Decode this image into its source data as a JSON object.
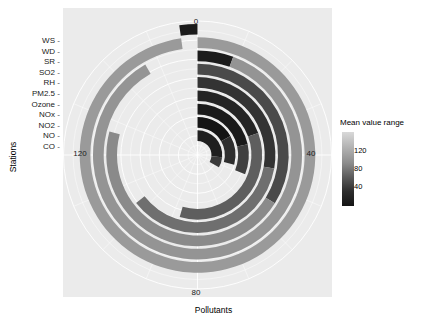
{
  "figure": {
    "background": "#ffffff",
    "panel_background": "#ebebeb",
    "grid_color": "#ffffff"
  },
  "axes": {
    "y_title": "Stations",
    "x_title": "Pollutants"
  },
  "legend": {
    "title": "Mean value range",
    "ticks": [
      "120",
      "80",
      "40"
    ],
    "gradient_high": "#d9d9d9",
    "gradient_low": "#141414"
  },
  "chart_data": {
    "type": "bar",
    "title": "",
    "subtitle": "",
    "xlabel": "Pollutants",
    "ylabel": "Stations",
    "coord": "polar-spiral",
    "grid": true,
    "legend_position": "right",
    "legend_title": "Mean value range",
    "legend_ticks": [
      120,
      80,
      40
    ],
    "colorscale": "grayscale (dark = low mean value, light = high mean value)",
    "angular_axis": {
      "label": "Pollutants",
      "ticks": [
        0,
        40,
        80,
        120
      ],
      "tick_labels": [
        "0",
        "40",
        "80",
        "120"
      ],
      "tick_angles_deg": [
        0,
        90,
        180,
        270
      ],
      "range": [
        0,
        160
      ]
    },
    "radial_axis": {
      "label": "Stations",
      "categories": [
        "CO",
        "NO",
        "NO2",
        "NOx",
        "Ozone",
        "PM2.5",
        "RH",
        "SO2",
        "SR",
        "WD",
        "WS"
      ],
      "tick_labels": [
        "WS",
        "WD",
        "SR",
        "SO2",
        "RH",
        "PM2.5",
        "Ozone",
        "NOx",
        "NO2",
        "NO",
        "CO"
      ],
      "note": "tick labels listed top-to-bottom as rendered on the left axis"
    },
    "categories": [
      "CO",
      "NO",
      "NO2",
      "NOx",
      "Ozone",
      "PM2.5",
      "RH",
      "SO2",
      "SR",
      "WD",
      "WS"
    ],
    "series": [
      {
        "name": "Mean value range",
        "description": "Spiral bars: each station occupies one turn of the spiral; bar extent is the angular sweep and the fill encodes the mean value.",
        "values": [
          10,
          22,
          36,
          48,
          62,
          78,
          95,
          112,
          128,
          140,
          152
        ],
        "fills": [
          "#1a1a1a",
          "#2b2b2b",
          "#3d3d3d",
          "#262626",
          "#333333",
          "#4f4f4f",
          "#6b6b6b",
          "#7a7a7a",
          "#8c8c8c",
          "#9e9e9e",
          "#a6a6a6"
        ]
      }
    ],
    "spiral_segments": [
      {
        "ring": 0,
        "name": "CO",
        "start_deg": 0,
        "end_deg": 95,
        "fill": "#1f1f1f",
        "mean_value": 18
      },
      {
        "ring": 0,
        "name": "CO-b",
        "start_deg": 95,
        "end_deg": 120,
        "fill": "#3a3a3a",
        "mean_value": 34
      },
      {
        "ring": 1,
        "name": "NO",
        "start_deg": 0,
        "end_deg": 60,
        "fill": "#141414",
        "mean_value": 12
      },
      {
        "ring": 1,
        "name": "NO-b",
        "start_deg": 60,
        "end_deg": 105,
        "fill": "#2e2e2e",
        "mean_value": 28
      },
      {
        "ring": 2,
        "name": "NO2",
        "start_deg": 0,
        "end_deg": 78,
        "fill": "#1a1a1a",
        "mean_value": 20
      },
      {
        "ring": 2,
        "name": "NO2-b",
        "start_deg": 78,
        "end_deg": 112,
        "fill": "#3f3f3f",
        "mean_value": 40
      },
      {
        "ring": 3,
        "name": "NOx",
        "start_deg": 0,
        "end_deg": 70,
        "fill": "#242424",
        "mean_value": 24
      },
      {
        "ring": 3,
        "name": "NOx-b",
        "start_deg": 70,
        "end_deg": 196,
        "fill": "#5e5e5e",
        "mean_value": 60
      },
      {
        "ring": 4,
        "name": "Ozone",
        "start_deg": 0,
        "end_deg": 100,
        "fill": "#333333",
        "mean_value": 33
      },
      {
        "ring": 4,
        "name": "Ozone-b",
        "start_deg": 100,
        "end_deg": 232,
        "fill": "#6f6f6f",
        "mean_value": 72
      },
      {
        "ring": 5,
        "name": "PM2.5",
        "start_deg": 0,
        "end_deg": 122,
        "fill": "#4a4a4a",
        "mean_value": 46
      },
      {
        "ring": 5,
        "name": "PM2.5-b",
        "start_deg": 122,
        "end_deg": 285,
        "fill": "#8a8a8a",
        "mean_value": 92
      },
      {
        "ring": 6,
        "name": "RH",
        "start_deg": 0,
        "end_deg": 20,
        "fill": "#1c1c1c",
        "mean_value": 16
      },
      {
        "ring": 6,
        "name": "RH-b",
        "start_deg": 20,
        "end_deg": 330,
        "fill": "#949494",
        "mean_value": 104
      },
      {
        "ring": 7,
        "name": "SR",
        "start_deg": 0,
        "end_deg": 352,
        "fill": "#9a9a9a",
        "mean_value": 118
      },
      {
        "ring": 8,
        "name": "WS",
        "start_deg": 352,
        "end_deg": 360,
        "fill": "#1a1a1a",
        "mean_value": 8
      }
    ]
  }
}
